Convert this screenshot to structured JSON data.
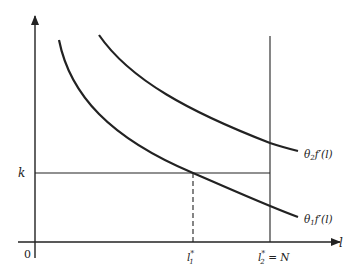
{
  "diagram": {
    "type": "economics-marginal-product-diagram",
    "axes": {
      "x_label": "l",
      "origin_label": "0"
    },
    "curves": [
      {
        "id": "theta1",
        "label_main": "θ",
        "label_sub": "1",
        "label_rest": "f′(l)"
      },
      {
        "id": "theta2",
        "label_main": "θ",
        "label_sub": "2",
        "label_rest": "f′(l)"
      }
    ],
    "levels": {
      "k_label": "k"
    },
    "x_markers": [
      {
        "id": "l1star",
        "base": "l",
        "sup": "*",
        "sub": "1",
        "suffix": ""
      },
      {
        "id": "l2star",
        "base": "l",
        "sup": "*",
        "sub": "2",
        "suffix": " = N"
      }
    ],
    "colors": {
      "ink": "#222222",
      "background": "#ffffff"
    }
  }
}
